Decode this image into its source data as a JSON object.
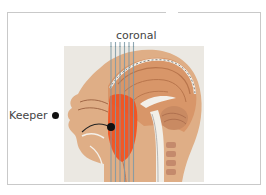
{
  "diagram": {
    "labels": {
      "coronal": "coronal",
      "keeper": "Keeper"
    },
    "colors": {
      "frame_border": "#c9c9c9",
      "skin": "#d9a57a",
      "brain": "#d99a6c",
      "highlight_region": "#f2501e",
      "coronal_lines": "#7d9aa6",
      "keeper_dot": "#111111",
      "background": "#e9e6e0"
    },
    "coronal_line_count": 6
  }
}
